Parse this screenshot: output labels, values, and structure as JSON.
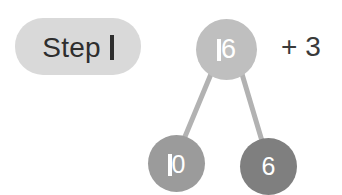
{
  "canvas": {
    "width": 342,
    "height": 195,
    "background": "#ffffff"
  },
  "step_badge": {
    "label": "Step",
    "number": "1",
    "full_text": "Step 1",
    "background": "#d9d9d9",
    "text_color": "#2e2e2e"
  },
  "number_bond": {
    "type": "number-bond-tree",
    "root": {
      "value": "16",
      "value_prefix": "",
      "value_suffix": "6",
      "color": "#bfbfbf",
      "text_color": "#ffffff"
    },
    "children": [
      {
        "value": "10",
        "value_suffix": "0",
        "color": "#9b9b9b",
        "text_color": "#ffffff"
      },
      {
        "value": "6",
        "value_suffix": "6",
        "color": "#7f7f7f",
        "text_color": "#ffffff"
      }
    ],
    "connector_color": "#b2b2b2"
  },
  "operation": {
    "text": "+ 3",
    "color": "#3a3a3a"
  }
}
